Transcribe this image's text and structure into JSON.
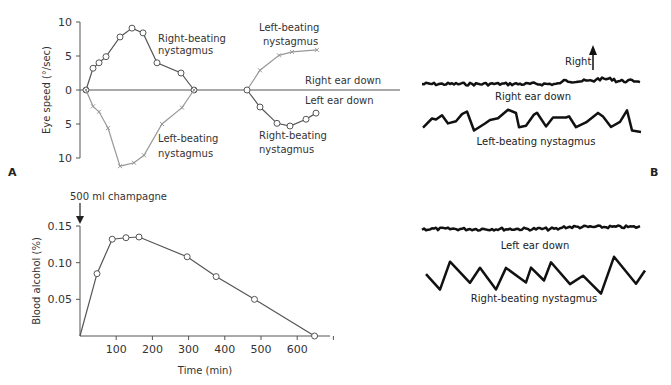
{
  "panels": {
    "a_label": "A",
    "b_label": "B"
  },
  "chart_data": [
    {
      "type": "line",
      "title": "",
      "ylabel": "Eye speed (°/sec)",
      "xlabel": "",
      "yticks": [
        "10",
        "5",
        "0",
        "5",
        "10"
      ],
      "ylim": [
        -10,
        10
      ],
      "x_units": "time (relative, corresponds to lower panel)",
      "series": [
        {
          "name": "Right-beating nystagmus",
          "phase": "right ear down",
          "marker": "circle",
          "color": "#555555",
          "x": [
            0,
            7,
            13,
            20,
            34,
            46,
            57,
            71,
            95,
            108
          ],
          "y": [
            0,
            3.2,
            4.0,
            4.9,
            7.8,
            9.1,
            8.4,
            4.0,
            2.5,
            0
          ]
        },
        {
          "name": "Left-beating nystagmus",
          "phase": "right ear down",
          "marker": "cross",
          "color": "#999999",
          "x": [
            0,
            7,
            13,
            22,
            34,
            48,
            58,
            76,
            96,
            108
          ],
          "y": [
            0,
            -2.4,
            -3.2,
            -5.6,
            -11.2,
            -10.7,
            -9.6,
            -5.0,
            -2.6,
            0
          ]
        },
        {
          "name": "Left-beating nystagmus",
          "phase": "left ear down",
          "marker": "cross",
          "color": "#999999",
          "x": [
            161,
            174,
            193,
            206,
            231
          ],
          "y": [
            0,
            2.9,
            5.1,
            5.6,
            5.9
          ]
        },
        {
          "name": "Right-beating nystagmus",
          "phase": "left ear down",
          "marker": "circle",
          "color": "#555555",
          "x": [
            161,
            174,
            191,
            204,
            220,
            230
          ],
          "y": [
            0,
            -2.5,
            -4.9,
            -5.3,
            -4.3,
            -3.4
          ]
        }
      ],
      "annotations": [
        "Right-beating\nnystagmus",
        "Left-beating\nnystagmus",
        "Left-beating\nnystagmus",
        "Right ear down",
        "Left ear down",
        "Right-beating\nnystagmus"
      ]
    },
    {
      "type": "line",
      "title": "",
      "xlabel": "Time (min)",
      "ylabel": "Blood alcohol (%)",
      "xticks": [
        "100",
        "200",
        "300",
        "400",
        "500",
        "600"
      ],
      "yticks": [
        "0.15",
        "0.10",
        "0.05"
      ],
      "xlim": [
        0,
        700
      ],
      "ylim": [
        0,
        0.15
      ],
      "annotation": "500 ml champagne",
      "series": [
        {
          "name": "Blood alcohol",
          "marker": "circle",
          "color": "#555555",
          "x": [
            0,
            47,
            89,
            127,
            163,
            296,
            376,
            482,
            648
          ],
          "y": [
            0,
            0.085,
            0.132,
            0.134,
            0.135,
            0.108,
            0.081,
            0.05,
            0.0
          ]
        }
      ]
    }
  ],
  "traces": {
    "right_label": "Right",
    "right_ear_down": "Right ear down",
    "left_beating": "Left-beating nystagmus",
    "left_ear_down": "Left ear down",
    "right_beating": "Right-beating nystagmus"
  },
  "top_labels": {
    "rb1a": "Right-beating",
    "rb1b": "nystagmus",
    "lb1a": "Left-beating",
    "lb1b": "nystagmus",
    "lb2a": "Left-beating",
    "lb2b": "nystagmus",
    "red": "Right ear down",
    "led": "Left ear down",
    "rb2a": "Right-beating",
    "rb2b": "nystagmus"
  }
}
